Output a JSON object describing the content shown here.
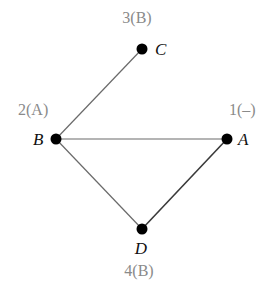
{
  "diagram": {
    "type": "graph",
    "nodes": [
      {
        "id": "A",
        "label": "A",
        "order": "1(–)",
        "x": 227,
        "y": 139
      },
      {
        "id": "B",
        "label": "B",
        "order": "2(A)",
        "x": 56,
        "y": 139
      },
      {
        "id": "C",
        "label": "C",
        "order": "3(B)",
        "x": 142,
        "y": 49
      },
      {
        "id": "D",
        "label": "D",
        "order": "4(B)",
        "x": 142,
        "y": 229
      }
    ],
    "edges": [
      {
        "from": "B",
        "to": "C"
      },
      {
        "from": "B",
        "to": "A"
      },
      {
        "from": "B",
        "to": "D"
      },
      {
        "from": "A",
        "to": "D"
      }
    ],
    "colors": {
      "edge": "#6a6a6a",
      "node": "#000000",
      "node_label": "#111111",
      "order_label": "#8a8a8a"
    }
  }
}
